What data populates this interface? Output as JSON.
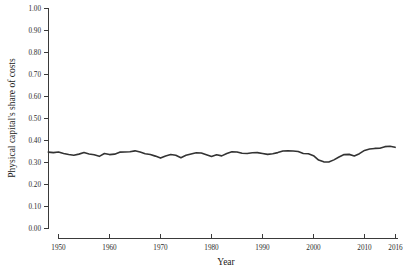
{
  "chart_data": {
    "type": "line",
    "title": "",
    "subtitle": "",
    "xlabel": "Year",
    "ylabel": "Physical capital's share of costs",
    "xlim": [
      1948,
      2016
    ],
    "ylim": [
      0.0,
      1.0
    ],
    "grid": false,
    "legend": "none",
    "xticks": [
      1950,
      1960,
      1970,
      1980,
      1990,
      2000,
      2010,
      2016
    ],
    "xticklabels": [
      "1950",
      "1960",
      "1970",
      "1980",
      "1990",
      "2000",
      "2010",
      "2016"
    ],
    "yticks": [
      0.0,
      0.1,
      0.2,
      0.3,
      0.4,
      0.5,
      0.6,
      0.7,
      0.8,
      0.9,
      1.0
    ],
    "yticklabels": [
      "0.00",
      "0.10",
      "0.20",
      "0.30",
      "0.40",
      "0.50",
      "0.60",
      "0.70",
      "0.80",
      "0.90",
      "1.00"
    ],
    "line_color": "#333333",
    "line_width": 1.6,
    "series": [
      {
        "name": "Physical capital's share of costs",
        "x": [
          1948,
          1949,
          1950,
          1951,
          1952,
          1953,
          1954,
          1955,
          1956,
          1957,
          1958,
          1959,
          1960,
          1961,
          1962,
          1963,
          1964,
          1965,
          1966,
          1967,
          1968,
          1969,
          1970,
          1971,
          1972,
          1973,
          1974,
          1975,
          1976,
          1977,
          1978,
          1979,
          1980,
          1981,
          1982,
          1983,
          1984,
          1985,
          1986,
          1987,
          1988,
          1989,
          1990,
          1991,
          1992,
          1993,
          1994,
          1995,
          1996,
          1997,
          1998,
          1999,
          2000,
          2001,
          2002,
          2003,
          2004,
          2005,
          2006,
          2007,
          2008,
          2009,
          2010,
          2011,
          2012,
          2013,
          2014,
          2015,
          2016
        ],
        "values": [
          0.347,
          0.345,
          0.348,
          0.341,
          0.336,
          0.333,
          0.338,
          0.345,
          0.339,
          0.335,
          0.328,
          0.341,
          0.336,
          0.338,
          0.347,
          0.348,
          0.349,
          0.353,
          0.348,
          0.34,
          0.336,
          0.329,
          0.32,
          0.33,
          0.336,
          0.333,
          0.322,
          0.333,
          0.339,
          0.344,
          0.343,
          0.335,
          0.327,
          0.335,
          0.33,
          0.341,
          0.349,
          0.348,
          0.342,
          0.341,
          0.344,
          0.345,
          0.341,
          0.337,
          0.34,
          0.345,
          0.352,
          0.353,
          0.352,
          0.35,
          0.341,
          0.34,
          0.331,
          0.311,
          0.303,
          0.302,
          0.312,
          0.325,
          0.336,
          0.337,
          0.33,
          0.34,
          0.355,
          0.361,
          0.364,
          0.365,
          0.372,
          0.374,
          0.369
        ],
        "value_range": [
          0.3,
          0.375
        ],
        "first_value": 0.347,
        "last_value": 0.369,
        "min_value": 0.302,
        "min_year": 2003,
        "max_value": 0.374,
        "max_year": 2015
      }
    ]
  },
  "axes": {
    "x_title": "Year",
    "y_title": "Physical capital's share of costs"
  }
}
